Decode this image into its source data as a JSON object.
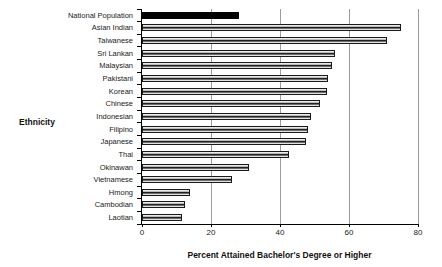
{
  "chart_data": {
    "type": "bar",
    "orientation": "horizontal",
    "title": "",
    "xlabel": "Percent Attained Bachelor's Degree or Higher",
    "ylabel": "Ethnicity",
    "xlim": [
      0,
      80
    ],
    "xticks": [
      0,
      20,
      40,
      60,
      80
    ],
    "grid": "vertical gridlines at each x tick, drawn behind bars",
    "legend": "none",
    "categories": [
      "National Population",
      "Asian Indian",
      "Taiwanese",
      "Sri Lankan",
      "Malaysian",
      "Pakistani",
      "Korean",
      "Chinese",
      "Indonesian",
      "Filipino",
      "Japanese",
      "Thai",
      "Okinawan",
      "Vietnamese",
      "Hmong",
      "Cambodian",
      "Laotian"
    ],
    "values": [
      28,
      75,
      71,
      56,
      55,
      54,
      53.5,
      51.5,
      49,
      48,
      47.5,
      42.5,
      31,
      26,
      14,
      12.5,
      11.5
    ],
    "highlight_category": "National Population",
    "colors": {
      "highlight_bar": "#000000",
      "bar_fill_light": "#f0f0f0",
      "bar_fill_dark_stripe": "#101010",
      "bar_outline": "#1a1a1a",
      "gridline": "#9c9c9c",
      "axis_line": "#000000",
      "text": "#1a1a1a",
      "background": "#ffffff"
    }
  }
}
